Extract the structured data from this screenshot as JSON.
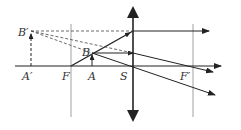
{
  "labels": {
    "A_prime": "A′",
    "B_prime": "B′",
    "F": "F",
    "A": "A",
    "B": "B",
    "S": "S",
    "F_prime": "F′"
  },
  "colors": {
    "line": "#222222",
    "guide": "#888888",
    "background": "#ffffff"
  },
  "elements": {
    "optical_axis": "principal axis with arrow to the right",
    "lens": "converging lens (double-arrow vertical line) at S",
    "focal_planes": [
      "F",
      "F′"
    ],
    "object": "arrow AB between F and lens",
    "image": "virtual dashed arrow A′B′",
    "rays": [
      "ray through F refracted parallel to axis",
      "ray parallel to axis refracted through F′",
      "ray through optical center S undeviated",
      "dashed back-extensions converging at B′"
    ]
  }
}
